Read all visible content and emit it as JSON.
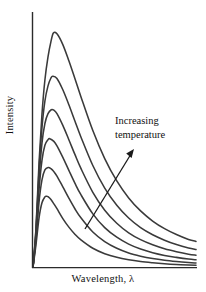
{
  "figure": {
    "background_color": "#ffffff",
    "axis_color": "#2b2b2b",
    "curve_color": "#3a3a3a",
    "text_color": "#111111"
  },
  "annotation": {
    "line1": "Increasing",
    "line2": "temperature",
    "arrow_name": "increasing-temperature-arrow"
  },
  "chart_data": {
    "type": "line",
    "title": "",
    "subtitle": "",
    "xlabel": "Wavelength, λ",
    "ylabel": "Intensity",
    "grid": false,
    "legend": null,
    "legend_position": "none",
    "axis_ticks": {
      "x": [],
      "y": []
    },
    "xlim": [
      0,
      1
    ],
    "ylim": [
      0,
      1
    ],
    "annotations": [
      {
        "text": "Increasing temperature",
        "arrow_from": [
          0.305,
          0.155
        ],
        "arrow_to": [
          0.595,
          0.455
        ]
      }
    ],
    "series": [
      {
        "name": "curve-1-coolest",
        "peak_x": 0.083,
        "peak_y": 0.289,
        "x": [
          0.0,
          0.018,
          0.037,
          0.055,
          0.073,
          0.083,
          0.092,
          0.11,
          0.128,
          0.147,
          0.183,
          0.22,
          0.257,
          0.294,
          0.367,
          0.44,
          0.514,
          0.587,
          0.66,
          0.734,
          0.807,
          0.88,
          0.954,
          1.0
        ],
        "y": [
          0.0,
          0.09,
          0.2,
          0.262,
          0.286,
          0.289,
          0.287,
          0.276,
          0.258,
          0.238,
          0.198,
          0.163,
          0.134,
          0.111,
          0.077,
          0.055,
          0.04,
          0.03,
          0.023,
          0.018,
          0.014,
          0.011,
          0.009,
          0.008
        ]
      },
      {
        "name": "curve-2",
        "peak_x": 0.094,
        "peak_y": 0.406,
        "x": [
          0.0,
          0.018,
          0.037,
          0.055,
          0.073,
          0.094,
          0.11,
          0.128,
          0.147,
          0.183,
          0.22,
          0.257,
          0.294,
          0.367,
          0.44,
          0.514,
          0.587,
          0.66,
          0.734,
          0.807,
          0.88,
          0.954,
          1.0
        ],
        "y": [
          0.0,
          0.11,
          0.265,
          0.355,
          0.396,
          0.406,
          0.401,
          0.389,
          0.371,
          0.327,
          0.281,
          0.238,
          0.201,
          0.143,
          0.104,
          0.077,
          0.058,
          0.045,
          0.035,
          0.028,
          0.023,
          0.019,
          0.017
        ]
      },
      {
        "name": "curve-3",
        "peak_x": 0.103,
        "peak_y": 0.523,
        "x": [
          0.0,
          0.018,
          0.037,
          0.055,
          0.073,
          0.092,
          0.103,
          0.128,
          0.147,
          0.183,
          0.22,
          0.257,
          0.294,
          0.367,
          0.44,
          0.514,
          0.587,
          0.66,
          0.734,
          0.807,
          0.88,
          0.954,
          1.0
        ],
        "y": [
          0.0,
          0.125,
          0.315,
          0.435,
          0.496,
          0.519,
          0.523,
          0.512,
          0.494,
          0.447,
          0.394,
          0.342,
          0.295,
          0.217,
          0.161,
          0.122,
          0.094,
          0.074,
          0.059,
          0.048,
          0.04,
          0.033,
          0.03
        ]
      },
      {
        "name": "curve-4",
        "peak_x": 0.112,
        "peak_y": 0.641,
        "x": [
          0.0,
          0.018,
          0.037,
          0.055,
          0.073,
          0.092,
          0.112,
          0.128,
          0.147,
          0.183,
          0.22,
          0.257,
          0.294,
          0.367,
          0.44,
          0.514,
          0.587,
          0.66,
          0.734,
          0.807,
          0.88,
          0.954,
          1.0
        ],
        "y": [
          0.0,
          0.138,
          0.358,
          0.505,
          0.585,
          0.625,
          0.641,
          0.639,
          0.625,
          0.577,
          0.519,
          0.459,
          0.402,
          0.305,
          0.232,
          0.179,
          0.14,
          0.112,
          0.091,
          0.075,
          0.063,
          0.053,
          0.049
        ]
      },
      {
        "name": "curve-5",
        "peak_x": 0.121,
        "peak_y": 0.777,
        "x": [
          0.0,
          0.018,
          0.037,
          0.055,
          0.073,
          0.092,
          0.11,
          0.121,
          0.147,
          0.183,
          0.22,
          0.257,
          0.294,
          0.367,
          0.44,
          0.514,
          0.587,
          0.66,
          0.734,
          0.807,
          0.88,
          0.954,
          1.0
        ],
        "y": [
          0.0,
          0.148,
          0.395,
          0.568,
          0.676,
          0.738,
          0.77,
          0.777,
          0.768,
          0.722,
          0.661,
          0.595,
          0.53,
          0.414,
          0.322,
          0.252,
          0.2,
          0.161,
          0.132,
          0.11,
          0.092,
          0.078,
          0.072
        ]
      },
      {
        "name": "curve-6-hottest",
        "peak_x": 0.125,
        "peak_y": 0.953,
        "x": [
          0.0,
          0.018,
          0.037,
          0.055,
          0.073,
          0.092,
          0.11,
          0.125,
          0.147,
          0.183,
          0.22,
          0.257,
          0.294,
          0.367,
          0.44,
          0.514,
          0.587,
          0.66,
          0.734,
          0.807,
          0.88,
          0.954,
          1.0
        ],
        "y": [
          0.0,
          0.155,
          0.425,
          0.623,
          0.762,
          0.856,
          0.918,
          0.953,
          0.95,
          0.906,
          0.84,
          0.768,
          0.694,
          0.556,
          0.442,
          0.351,
          0.282,
          0.229,
          0.188,
          0.157,
          0.133,
          0.113,
          0.105
        ]
      }
    ]
  }
}
